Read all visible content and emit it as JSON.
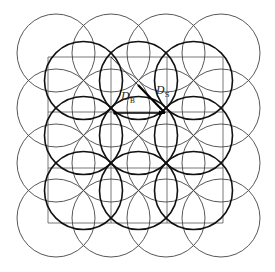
{
  "diagram": {
    "type": "circle-packing-lattice",
    "grid": {
      "x_lines": [
        48,
        111,
        167,
        223
      ],
      "y_lines": [
        57,
        112,
        168,
        223
      ],
      "color": "#555555"
    },
    "outer_circles": {
      "centers_x": [
        56,
        111,
        166,
        221
      ],
      "centers_y": [
        53,
        108,
        163,
        218
      ],
      "radius": 39,
      "color": "#444444",
      "stroke_width": 0.9
    },
    "inner_circles": {
      "centers_x": [
        83.5,
        138.5,
        193.5
      ],
      "centers_y": [
        80.5,
        135.5,
        190.5
      ],
      "radius": 39,
      "color": "#111111",
      "stroke_width": 1.6
    },
    "diagonal": {
      "thin": {
        "x1": 111,
        "y1": 57,
        "x2": 138,
        "y2": 85
      },
      "bold": {
        "x1": 138,
        "y1": 85,
        "x2": 165,
        "y2": 113
      }
    },
    "horizontal_arrow": {
      "x1": 115,
      "y1": 113,
      "x2": 165,
      "y2": 113
    },
    "labels": [
      {
        "id": "DB",
        "main": "D",
        "sub": "B",
        "x": 121,
        "y": 97
      },
      {
        "id": "DS",
        "main": "D",
        "sub": "S",
        "x": 156,
        "y": 91
      }
    ]
  }
}
